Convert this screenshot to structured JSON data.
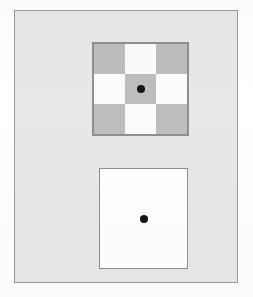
{
  "figure": {
    "kind": "brightness-contrast-stimulus-pair",
    "canvas": {
      "width": 253,
      "height": 297,
      "background": "#ffffff"
    },
    "frame": {
      "background": "#e8e8e8",
      "border_color": "#9a9a9a",
      "x": 14,
      "y": 10,
      "width": 224,
      "height": 273
    }
  },
  "stimuli": [
    {
      "id": "checkerboard",
      "label": "",
      "position": {
        "x": 77,
        "y": 31,
        "width": 97,
        "height": 94
      },
      "border_color": "#8f8f8f",
      "border_width": 2,
      "grid": {
        "rows": 3,
        "cols": 3
      },
      "cell_colors": {
        "dark": "#bdbdbd",
        "light": "#fbfbfb"
      },
      "cells": [
        "dark",
        "light",
        "dark",
        "light",
        "dark",
        "light",
        "dark",
        "light",
        "dark"
      ],
      "center_cell_shade": "dark",
      "fixation_dot": {
        "color": "#141414",
        "diameter": 8,
        "position": "center"
      }
    },
    {
      "id": "plain-square",
      "label": "",
      "position": {
        "x": 84,
        "y": 157,
        "width": 89,
        "height": 101
      },
      "border_color": "#8f8f8f",
      "border_width": 1,
      "fill_color": "#ffffff",
      "fixation_dot": {
        "color": "#141414",
        "diameter": 8,
        "position": "center"
      }
    }
  ],
  "colors": {
    "page_background": "#ffffff",
    "panel_background": "#e8e8e8",
    "panel_border": "#9a9a9a",
    "checker_dark": "#bdbdbd",
    "checker_light": "#fbfbfb",
    "checker_border": "#8f8f8f",
    "plain_fill": "#ffffff",
    "dot": "#141414"
  }
}
